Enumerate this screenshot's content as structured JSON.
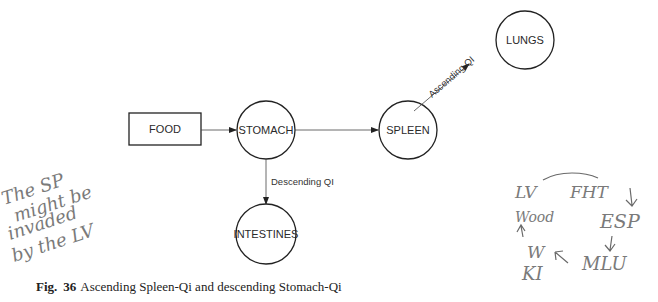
{
  "diagram": {
    "nodes": [
      {
        "id": "food",
        "label": "FOOD",
        "shape": "rectangle"
      },
      {
        "id": "stomach",
        "label": "STOMACH",
        "shape": "circle"
      },
      {
        "id": "spleen",
        "label": "SPLEEN",
        "shape": "circle"
      },
      {
        "id": "lungs",
        "label": "LUNGS",
        "shape": "circle"
      },
      {
        "id": "intestines",
        "label": "INTESTINES",
        "shape": "circle"
      }
    ],
    "edges": [
      {
        "from": "food",
        "to": "stomach",
        "label": ""
      },
      {
        "from": "stomach",
        "to": "spleen",
        "label": ""
      },
      {
        "from": "spleen",
        "to": "lungs",
        "label": "Ascending QI"
      },
      {
        "from": "stomach",
        "to": "intestines",
        "label": "Descending QI"
      }
    ]
  },
  "caption": {
    "fig": "Fig.",
    "number": "36",
    "text": "Ascending Spleen-Qi and descending Stomach-Qi"
  },
  "handwritten": {
    "left_note": [
      "The SP",
      "might be",
      "invaded",
      "by the LV"
    ],
    "right_cycle": {
      "labels": [
        "LV",
        "FHT",
        "Wood",
        "ESP",
        "W",
        "KI",
        "MLU"
      ]
    }
  }
}
